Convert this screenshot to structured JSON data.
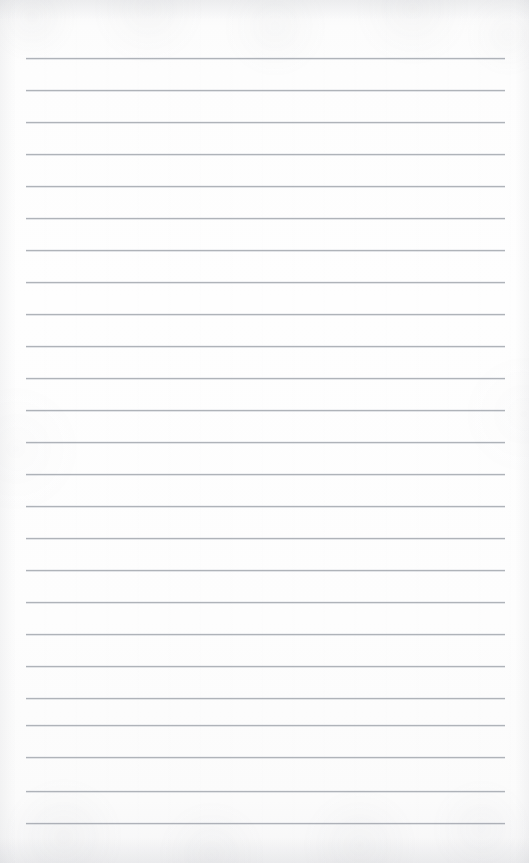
{
  "document": {
    "type": "scanned-ruled-notepad-page",
    "title": "Blank ruled notepad page",
    "orientation": "portrait",
    "page_width": 529,
    "page_height": 863,
    "background_color": "#fdfdfd",
    "paper_tint": "#fefefe",
    "has_handwriting": false,
    "has_printed_text": false,
    "has_margin_rule": false,
    "has_header": false,
    "has_footer": false,
    "has_page_number": false,
    "visible_text": "",
    "notes_content": ""
  },
  "ruling": {
    "line_color": "#a9adb4",
    "line_halo_color": "#d7dade",
    "line_thickness_px": 1,
    "line_left_x": 26,
    "line_right_x": 505,
    "line_width_px": 479,
    "first_line_y": 58,
    "line_spacing_px": 32,
    "line_count": 25,
    "line_y_positions": [
      58,
      90,
      122,
      154,
      186,
      218,
      250,
      282,
      314,
      346,
      378,
      410,
      442,
      474,
      506,
      538,
      570,
      602,
      634,
      666,
      698,
      725,
      757,
      791,
      823
    ]
  },
  "scan": {
    "grain_color": "#787d87",
    "vignette_color": "#a0a3aa",
    "edge_shadow_top": true,
    "edge_shadow_bottom": true
  }
}
